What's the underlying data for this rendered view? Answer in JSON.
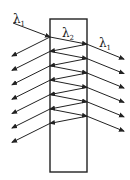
{
  "diagram": {
    "labels": {
      "incident": {
        "symbol": "λ",
        "sub": "1"
      },
      "slab": {
        "symbol": "λ",
        "sub": "2"
      },
      "transmitted": {
        "symbol": "λ",
        "sub": "1"
      }
    },
    "counts": {
      "reflected_rays_left": 7,
      "transmitted_rays_right": 6,
      "internal_bounces": 12
    },
    "colors": {
      "line": "#222222",
      "background": "#ffffff"
    }
  }
}
